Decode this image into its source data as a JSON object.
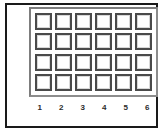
{
  "panel": {
    "name": "button-grid-panel",
    "rows": 4,
    "columns": 6,
    "cell_count": 24,
    "cells": [
      {
        "row": 1,
        "col": 1,
        "label": ""
      },
      {
        "row": 1,
        "col": 2,
        "label": ""
      },
      {
        "row": 1,
        "col": 3,
        "label": ""
      },
      {
        "row": 1,
        "col": 4,
        "label": ""
      },
      {
        "row": 1,
        "col": 5,
        "label": ""
      },
      {
        "row": 1,
        "col": 6,
        "label": ""
      },
      {
        "row": 2,
        "col": 1,
        "label": ""
      },
      {
        "row": 2,
        "col": 2,
        "label": ""
      },
      {
        "row": 2,
        "col": 3,
        "label": ""
      },
      {
        "row": 2,
        "col": 4,
        "label": ""
      },
      {
        "row": 2,
        "col": 5,
        "label": ""
      },
      {
        "row": 2,
        "col": 6,
        "label": ""
      },
      {
        "row": 3,
        "col": 1,
        "label": ""
      },
      {
        "row": 3,
        "col": 2,
        "label": ""
      },
      {
        "row": 3,
        "col": 3,
        "label": ""
      },
      {
        "row": 3,
        "col": 4,
        "label": ""
      },
      {
        "row": 3,
        "col": 5,
        "label": ""
      },
      {
        "row": 3,
        "col": 6,
        "label": ""
      },
      {
        "row": 4,
        "col": 1,
        "label": ""
      },
      {
        "row": 4,
        "col": 2,
        "label": ""
      },
      {
        "row": 4,
        "col": 3,
        "label": ""
      },
      {
        "row": 4,
        "col": 4,
        "label": ""
      },
      {
        "row": 4,
        "col": 5,
        "label": ""
      },
      {
        "row": 4,
        "col": 6,
        "label": ""
      }
    ]
  },
  "column_labels": [
    "1",
    "2",
    "3",
    "4",
    "5",
    "6"
  ],
  "colors": {
    "outer_border": "#1a1a1a",
    "panel_border": "#8c8c8c",
    "cell_border": "#4a4a4a",
    "cell_inner_border": "#d8d8d8",
    "cell_fill": "#ffffff",
    "label_text": "#2b2b2b",
    "background": "#ffffff"
  }
}
